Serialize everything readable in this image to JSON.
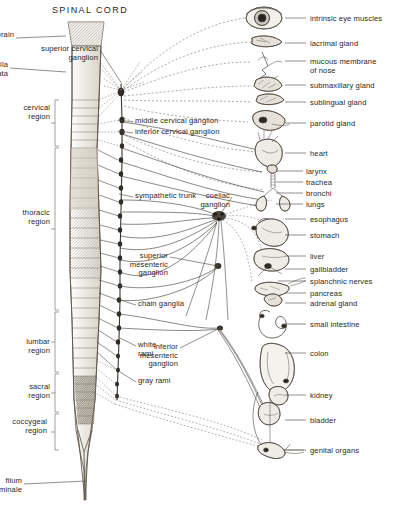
{
  "figure": {
    "title": "SPINAL CORD"
  },
  "spinal_cord": {
    "structures": [
      {
        "id": "midbrain",
        "label": "midbrain",
        "x": 14,
        "y": 31,
        "align": "l",
        "leader_to": [
          66,
          36
        ]
      },
      {
        "id": "medulla",
        "label": "medulla\noblongata",
        "x": 8,
        "y": 61,
        "align": "l",
        "leader_to": [
          66,
          72
        ]
      },
      {
        "id": "filum-terminale",
        "label": "filum\nterminale",
        "x": 22,
        "y": 477,
        "align": "l",
        "leader_to": [
          86,
          481
        ]
      }
    ],
    "regions": [
      {
        "id": "cervical",
        "label": "cervical\nregion",
        "x": 8,
        "y": 104,
        "bracket_top": 100,
        "bracket_bottom": 146
      },
      {
        "id": "thoracic",
        "label": "thoracic\nregion",
        "x": 8,
        "y": 209,
        "bracket_top": 148,
        "bracket_bottom": 310
      },
      {
        "id": "lumbar",
        "label": "lumbar\nregion",
        "x": 8,
        "y": 338,
        "bracket_top": 312,
        "bracket_bottom": 372
      },
      {
        "id": "sacral",
        "label": "sacral\nregion",
        "x": 8,
        "y": 383,
        "bracket_top": 374,
        "bracket_bottom": 412
      },
      {
        "id": "coccygeal",
        "label": "coccygeal\nregion",
        "x": 5,
        "y": 418,
        "bracket_top": 414,
        "bracket_bottom": 450
      }
    ]
  },
  "ganglia_labels": [
    {
      "id": "superior-cervical-ganglion",
      "label": "superior cervical\nganglion",
      "x": 98,
      "y": 45,
      "align": "l",
      "leader_to": [
        122,
        84
      ]
    },
    {
      "id": "middle-cervical-ganglion",
      "label": "middle cervical ganglion",
      "x": 135,
      "y": 117,
      "align": "r",
      "leader_to": [
        118,
        120
      ]
    },
    {
      "id": "inferior-cervical-ganglion",
      "label": "inferior cervical ganglion",
      "x": 135,
      "y": 128,
      "align": "r",
      "leader_to": [
        118,
        131
      ]
    },
    {
      "id": "sympathetic-trunk",
      "label": "sympathetic trunk",
      "x": 135,
      "y": 192,
      "align": "r",
      "leader_to": [
        119,
        194
      ]
    },
    {
      "id": "coeliac-ganglion",
      "label": "coeliac\nganglion",
      "x": 230,
      "y": 192,
      "align": "l",
      "leader_to": [
        219,
        216
      ]
    },
    {
      "id": "superior-mesenteric-ganglion",
      "label": "superior\nmesenteric\nganglion",
      "x": 168,
      "y": 252,
      "align": "l",
      "leader_to": [
        218,
        266
      ]
    },
    {
      "id": "chain-ganglia",
      "label": "chain ganglia",
      "x": 138,
      "y": 300,
      "align": "r",
      "leader_to": [
        120,
        300
      ]
    },
    {
      "id": "white-rami",
      "label": "white\nrami",
      "x": 138,
      "y": 341,
      "align": "r",
      "leader_to": [
        120,
        338
      ]
    },
    {
      "id": "gray-rami",
      "label": "gray rami",
      "x": 138,
      "y": 377,
      "align": "r",
      "leader_to": [
        120,
        372
      ]
    },
    {
      "id": "inferior-mesenteric-ganglion",
      "label": "inferior\nmesenteric\nganglion",
      "x": 178,
      "y": 343,
      "align": "l",
      "leader_to": [
        220,
        328
      ]
    }
  ],
  "organs": [
    {
      "id": "intrinsic-eye-muscles",
      "label": "intrinsic eye muscles",
      "text_x": 310,
      "text_y": 15,
      "leader_from": [
        285,
        18
      ],
      "leader_to": [
        306,
        18
      ]
    },
    {
      "id": "lacrimal-gland",
      "label": "lacrimal gland",
      "text_x": 310,
      "text_y": 40,
      "leader_from": [
        285,
        43
      ],
      "leader_to": [
        306,
        43
      ]
    },
    {
      "id": "mucous-membrane-nose",
      "label": "mucous membrane\nof nose",
      "text_x": 310,
      "text_y": 58,
      "leader_from": [
        285,
        61
      ],
      "leader_to": [
        306,
        61
      ]
    },
    {
      "id": "submaxillary-gland",
      "label": "submaxillary gland",
      "text_x": 310,
      "text_y": 82,
      "leader_from": [
        285,
        85
      ],
      "leader_to": [
        306,
        85
      ]
    },
    {
      "id": "sublingual-gland",
      "label": "sublingual gland",
      "text_x": 310,
      "text_y": 99,
      "leader_from": [
        285,
        102
      ],
      "leader_to": [
        306,
        102
      ]
    },
    {
      "id": "parotid-gland",
      "label": "parotid gland",
      "text_x": 310,
      "text_y": 120,
      "leader_from": [
        285,
        123
      ],
      "leader_to": [
        306,
        123
      ]
    },
    {
      "id": "heart",
      "label": "heart",
      "text_x": 310,
      "text_y": 150,
      "leader_from": [
        285,
        153
      ],
      "leader_to": [
        306,
        153
      ]
    },
    {
      "id": "larynx",
      "label": "larynx",
      "text_x": 306,
      "text_y": 168,
      "leader_from": [
        276,
        171
      ],
      "leader_to": [
        303,
        171
      ]
    },
    {
      "id": "trachea",
      "label": "trachea",
      "text_x": 306,
      "text_y": 179,
      "leader_from": [
        276,
        182
      ],
      "leader_to": [
        303,
        182
      ]
    },
    {
      "id": "bronchi",
      "label": "bronchi",
      "text_x": 306,
      "text_y": 190,
      "leader_from": [
        276,
        193
      ],
      "leader_to": [
        303,
        193
      ]
    },
    {
      "id": "lungs",
      "label": "lungs",
      "text_x": 306,
      "text_y": 201,
      "leader_from": [
        276,
        204
      ],
      "leader_to": [
        303,
        204
      ]
    },
    {
      "id": "esophagus",
      "label": "esophagus",
      "text_x": 310,
      "text_y": 216,
      "leader_from": [
        285,
        219
      ],
      "leader_to": [
        306,
        219
      ]
    },
    {
      "id": "stomach",
      "label": "stomach",
      "text_x": 310,
      "text_y": 232,
      "leader_from": [
        285,
        235
      ],
      "leader_to": [
        306,
        235
      ]
    },
    {
      "id": "liver",
      "label": "liver",
      "text_x": 310,
      "text_y": 253,
      "leader_from": [
        285,
        256
      ],
      "leader_to": [
        306,
        256
      ]
    },
    {
      "id": "gallbladder",
      "label": "gallbladder",
      "text_x": 310,
      "text_y": 266,
      "leader_from": [
        285,
        269
      ],
      "leader_to": [
        306,
        269
      ]
    },
    {
      "id": "splanchnic-nerves",
      "label": "splanchnic nerves",
      "text_x": 310,
      "text_y": 278,
      "leader_from": [
        278,
        281
      ],
      "leader_to": [
        306,
        281
      ]
    },
    {
      "id": "pancreas",
      "label": "pancreas",
      "text_x": 310,
      "text_y": 290,
      "leader_from": [
        285,
        293
      ],
      "leader_to": [
        306,
        293
      ]
    },
    {
      "id": "adrenal-gland",
      "label": "adrenal gland",
      "text_x": 310,
      "text_y": 300,
      "leader_from": [
        285,
        303
      ],
      "leader_to": [
        306,
        303
      ]
    },
    {
      "id": "small-intestine",
      "label": "small intestine",
      "text_x": 310,
      "text_y": 321,
      "leader_from": [
        285,
        324
      ],
      "leader_to": [
        306,
        324
      ]
    },
    {
      "id": "colon",
      "label": "colon",
      "text_x": 310,
      "text_y": 350,
      "leader_from": [
        285,
        353
      ],
      "leader_to": [
        306,
        353
      ]
    },
    {
      "id": "kidney",
      "label": "kidney",
      "text_x": 310,
      "text_y": 392,
      "leader_from": [
        285,
        395
      ],
      "leader_to": [
        306,
        395
      ]
    },
    {
      "id": "bladder",
      "label": "bladder",
      "text_x": 310,
      "text_y": 417,
      "leader_from": [
        285,
        420
      ],
      "leader_to": [
        306,
        420
      ]
    },
    {
      "id": "genital-organs",
      "label": "genital organs",
      "text_x": 310,
      "text_y": 447,
      "leader_from": [
        285,
        450
      ],
      "leader_to": [
        306,
        450
      ]
    }
  ],
  "colors": {
    "ink": "#2a2724",
    "line": "#4a4540",
    "cord_fill": "#e9e6de",
    "cord_fill_dark": "#b9b2a4",
    "background": "#ffffff"
  }
}
